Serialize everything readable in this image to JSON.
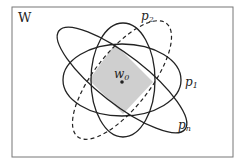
{
  "diagram": {
    "frame_label": "W",
    "center_label": "w",
    "center_sub": "0",
    "sets": [
      {
        "name": "p",
        "sub": "1",
        "style": "solid"
      },
      {
        "name": "p",
        "sub": "2",
        "style": "solid"
      },
      {
        "name": "p",
        "sub": "n",
        "style": "solid"
      },
      {
        "name": "",
        "sub": "",
        "style": "dashed"
      }
    ],
    "colors": {
      "stroke": "#222222",
      "fill": "#cfcfcf",
      "frame": "#777777"
    }
  }
}
